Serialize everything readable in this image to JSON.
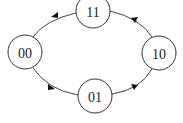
{
  "diagram": {
    "type": "state-transition-cycle",
    "nodes": [
      {
        "id": "00",
        "label": "00",
        "cx": 25,
        "cy": 52,
        "r": 17
      },
      {
        "id": "01",
        "label": "01",
        "cx": 95,
        "cy": 96,
        "r": 17
      },
      {
        "id": "10",
        "label": "10",
        "cx": 159,
        "cy": 53,
        "r": 17
      },
      {
        "id": "11",
        "label": "11",
        "cx": 93,
        "cy": 11,
        "r": 17
      }
    ],
    "edges": [
      {
        "from": "00",
        "to": "01"
      },
      {
        "from": "01",
        "to": "10"
      },
      {
        "from": "10",
        "to": "11"
      },
      {
        "from": "11",
        "to": "00"
      }
    ],
    "colors": {
      "stroke": "#333333",
      "arrow": "#111111",
      "background": "#ffffff"
    }
  }
}
